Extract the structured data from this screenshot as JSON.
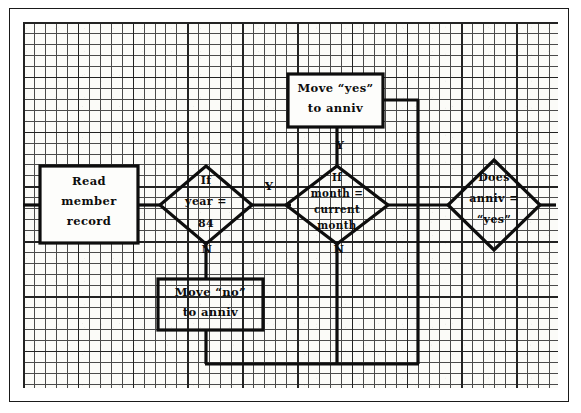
{
  "diagram": {
    "type": "flowchart",
    "medium": "hand-drawn on quadrille graph paper",
    "colors": {
      "ink": "#0d0d0d",
      "paper": "#fbfbf8",
      "grid_minor": "#4a4a4a",
      "grid_major": "#222222",
      "fill": "#ffffff"
    },
    "nodes": [
      {
        "id": "read-member-record",
        "shape": "process",
        "lines": [
          "Read",
          "member",
          "record"
        ],
        "text": "Read member record",
        "fill": "opaque-white"
      },
      {
        "id": "move-yes-to-anniv",
        "shape": "process",
        "lines": [
          "Move “yes”",
          "to anniv"
        ],
        "text": "Move “yes” to anniv",
        "fill": "opaque-white"
      },
      {
        "id": "move-no-to-anniv",
        "shape": "process",
        "lines": [
          "Move “no”",
          "to anniv"
        ],
        "text": "Move “no” to anniv",
        "fill": "transparent"
      },
      {
        "id": "if-year-84",
        "shape": "decision",
        "lines": [
          "If",
          "year =",
          "84"
        ],
        "text": "If year = 84",
        "fill": "transparent"
      },
      {
        "id": "if-month-current-month",
        "shape": "decision",
        "lines": [
          "If",
          "month =",
          "current",
          "month"
        ],
        "text": "If month = current month",
        "fill": "transparent"
      },
      {
        "id": "does-anniv-yes",
        "shape": "decision",
        "lines": [
          "Does",
          "anniv =",
          "“yes”"
        ],
        "text": "Does anniv = “yes”",
        "fill": "transparent"
      }
    ],
    "branch_labels": {
      "year_yes": "Y",
      "year_no": "N",
      "month_yes": "Y",
      "month_no": "N"
    },
    "edges": [
      {
        "from": "read-member-record",
        "to": "if-year-84",
        "label": ""
      },
      {
        "from": "if-year-84",
        "to": "if-month-current-month",
        "label": "Y"
      },
      {
        "from": "if-year-84",
        "to": "move-no-to-anniv",
        "label": "N"
      },
      {
        "from": "if-month-current-month",
        "to": "move-yes-to-anniv",
        "label": "Y"
      },
      {
        "from": "if-month-current-month",
        "to": "bottom-return",
        "label": "N"
      },
      {
        "from": "move-no-to-anniv",
        "to": "bottom-return",
        "label": ""
      },
      {
        "from": "bottom-return",
        "to": "move-yes-to-anniv",
        "label": ""
      },
      {
        "from": "move-yes-to-anniv",
        "to": "does-anniv-yes",
        "label": ""
      }
    ]
  }
}
